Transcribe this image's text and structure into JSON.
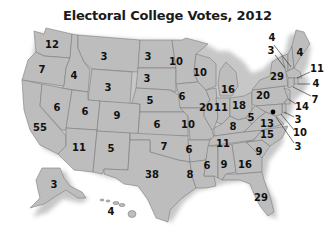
{
  "title": "Electoral College Votes, 2012",
  "colors": {
    "state_fill": "#bdbdbd",
    "state_border": "#7d7d7d",
    "label": "#111111",
    "background": "#ffffff"
  },
  "states": [
    {
      "id": "WA",
      "votes": "12",
      "x": 52,
      "y": 45
    },
    {
      "id": "OR",
      "votes": "7",
      "x": 42,
      "y": 70
    },
    {
      "id": "CA",
      "votes": "55",
      "x": 40,
      "y": 128
    },
    {
      "id": "NV",
      "votes": "6",
      "x": 57,
      "y": 108
    },
    {
      "id": "ID",
      "votes": "4",
      "x": 74,
      "y": 76
    },
    {
      "id": "MT",
      "votes": "3",
      "x": 104,
      "y": 57
    },
    {
      "id": "WY",
      "votes": "3",
      "x": 108,
      "y": 88
    },
    {
      "id": "UT",
      "votes": "6",
      "x": 85,
      "y": 112
    },
    {
      "id": "CO",
      "votes": "9",
      "x": 117,
      "y": 116
    },
    {
      "id": "AZ",
      "votes": "11",
      "x": 79,
      "y": 148
    },
    {
      "id": "NM",
      "votes": "5",
      "x": 111,
      "y": 149
    },
    {
      "id": "ND",
      "votes": "3",
      "x": 148,
      "y": 57
    },
    {
      "id": "SD",
      "votes": "3",
      "x": 147,
      "y": 79
    },
    {
      "id": "NE",
      "votes": "5",
      "x": 150,
      "y": 101
    },
    {
      "id": "KS",
      "votes": "6",
      "x": 157,
      "y": 125
    },
    {
      "id": "OK",
      "votes": "7",
      "x": 164,
      "y": 147
    },
    {
      "id": "TX",
      "votes": "38",
      "x": 152,
      "y": 175
    },
    {
      "id": "MN",
      "votes": "10",
      "x": 176,
      "y": 62
    },
    {
      "id": "IA",
      "votes": "6",
      "x": 182,
      "y": 97
    },
    {
      "id": "MO",
      "votes": "10",
      "x": 188,
      "y": 125
    },
    {
      "id": "AR",
      "votes": "6",
      "x": 189,
      "y": 150
    },
    {
      "id": "LA",
      "votes": "8",
      "x": 190,
      "y": 175
    },
    {
      "id": "WI",
      "votes": "10",
      "x": 200,
      "y": 73
    },
    {
      "id": "IL",
      "votes": "20",
      "x": 206,
      "y": 108
    },
    {
      "id": "MI",
      "votes": "16",
      "x": 228,
      "y": 90
    },
    {
      "id": "IN",
      "votes": "11",
      "x": 221,
      "y": 108
    },
    {
      "id": "OH",
      "votes": "18",
      "x": 239,
      "y": 106
    },
    {
      "id": "KY",
      "votes": "8",
      "x": 233,
      "y": 127
    },
    {
      "id": "TN",
      "votes": "11",
      "x": 223,
      "y": 144
    },
    {
      "id": "MS",
      "votes": "6",
      "x": 207,
      "y": 166
    },
    {
      "id": "AL",
      "votes": "9",
      "x": 224,
      "y": 165
    },
    {
      "id": "GA",
      "votes": "16",
      "x": 245,
      "y": 165
    },
    {
      "id": "FL",
      "votes": "29",
      "x": 261,
      "y": 198
    },
    {
      "id": "SC",
      "votes": "9",
      "x": 259,
      "y": 152
    },
    {
      "id": "NC",
      "votes": "15",
      "x": 267,
      "y": 135
    },
    {
      "id": "VA",
      "votes": "13",
      "x": 267,
      "y": 124
    },
    {
      "id": "WV",
      "votes": "5",
      "x": 251,
      "y": 118
    },
    {
      "id": "PA",
      "votes": "20",
      "x": 263,
      "y": 96
    },
    {
      "id": "NY",
      "votes": "29",
      "x": 277,
      "y": 77
    },
    {
      "id": "AK",
      "votes": "3",
      "x": 54,
      "y": 185
    },
    {
      "id": "HI",
      "votes": "4",
      "x": 111,
      "y": 212
    }
  ],
  "callouts": [
    {
      "id": "NH",
      "votes": "4",
      "x": 272,
      "y": 38,
      "lx1": 274,
      "ly1": 45,
      "lx2": 291,
      "ly2": 67
    },
    {
      "id": "VT",
      "votes": "3",
      "x": 271,
      "y": 51,
      "lx1": 275,
      "ly1": 55,
      "lx2": 285,
      "ly2": 68
    },
    {
      "id": "ME",
      "votes": "4",
      "x": 300,
      "y": 53,
      "lx1": 0,
      "ly1": 0,
      "lx2": 0,
      "ly2": 0
    },
    {
      "id": "MA",
      "votes": "11",
      "x": 317,
      "y": 69,
      "lx1": 310,
      "ly1": 72,
      "lx2": 297,
      "ly2": 78
    },
    {
      "id": "RI",
      "votes": "4",
      "x": 316,
      "y": 84,
      "lx1": 310,
      "ly1": 84,
      "lx2": 298,
      "ly2": 84
    },
    {
      "id": "CT",
      "votes": "7",
      "x": 315,
      "y": 100,
      "lx1": 311,
      "ly1": 96,
      "lx2": 293,
      "ly2": 87
    },
    {
      "id": "NJ",
      "votes": "14",
      "x": 302,
      "y": 107,
      "lx1": 296,
      "ly1": 104,
      "lx2": 288,
      "ly2": 99
    },
    {
      "id": "DE",
      "votes": "3",
      "x": 298,
      "y": 120,
      "lx1": 294,
      "ly1": 117,
      "lx2": 284,
      "ly2": 112
    },
    {
      "id": "MD",
      "votes": "10",
      "x": 300,
      "y": 133,
      "lx1": 294,
      "ly1": 130,
      "lx2": 281,
      "ly2": 114
    },
    {
      "id": "DC",
      "votes": "3",
      "x": 298,
      "y": 147,
      "lx1": 294,
      "ly1": 143,
      "lx2": 276,
      "ly2": 117
    }
  ],
  "capital_marker": {
    "label": "Washington DC",
    "x": 273,
    "y": 112
  }
}
